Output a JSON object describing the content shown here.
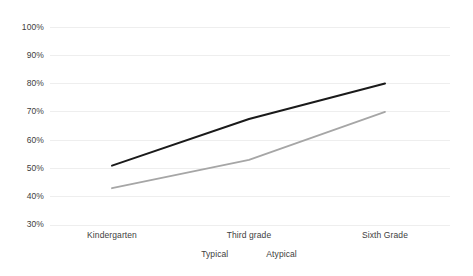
{
  "chart_data": {
    "type": "line",
    "title": "",
    "xlabel": "",
    "ylabel": "",
    "categories": [
      "Kindergarten",
      "Third grade",
      "Sixth Grade"
    ],
    "series": [
      {
        "name": "Typical",
        "values": [
          51,
          67.5,
          80
        ],
        "color": "#1a1a1a",
        "width": 2.0
      },
      {
        "name": "Atypical",
        "values": [
          43,
          53,
          70
        ],
        "color": "#a6a6a6",
        "width": 1.8
      }
    ],
    "ylim": [
      30,
      100
    ],
    "ytick_labels": [
      "100%",
      "90%",
      "80%",
      "70%",
      "60%",
      "50%",
      "40%",
      "30%"
    ],
    "ytick_values": [
      100,
      90,
      80,
      70,
      60,
      50,
      40,
      30
    ],
    "grid": true,
    "grid_color": "#eeeeee",
    "legend_position": "bottom",
    "background_color": "#ffffff",
    "text_color": "#404040"
  },
  "yaxis": {
    "ticks": [
      {
        "label": "100%"
      },
      {
        "label": "90%"
      },
      {
        "label": "80%"
      },
      {
        "label": "70%"
      },
      {
        "label": "60%"
      },
      {
        "label": "50%"
      },
      {
        "label": "40%"
      },
      {
        "label": "30%"
      }
    ]
  },
  "xaxis": {
    "ticks": [
      {
        "label": "Kindergarten"
      },
      {
        "label": "Third grade"
      },
      {
        "label": "Sixth Grade"
      }
    ]
  },
  "legend": {
    "items": [
      {
        "label": "Typical"
      },
      {
        "label": "Atypical"
      }
    ]
  }
}
